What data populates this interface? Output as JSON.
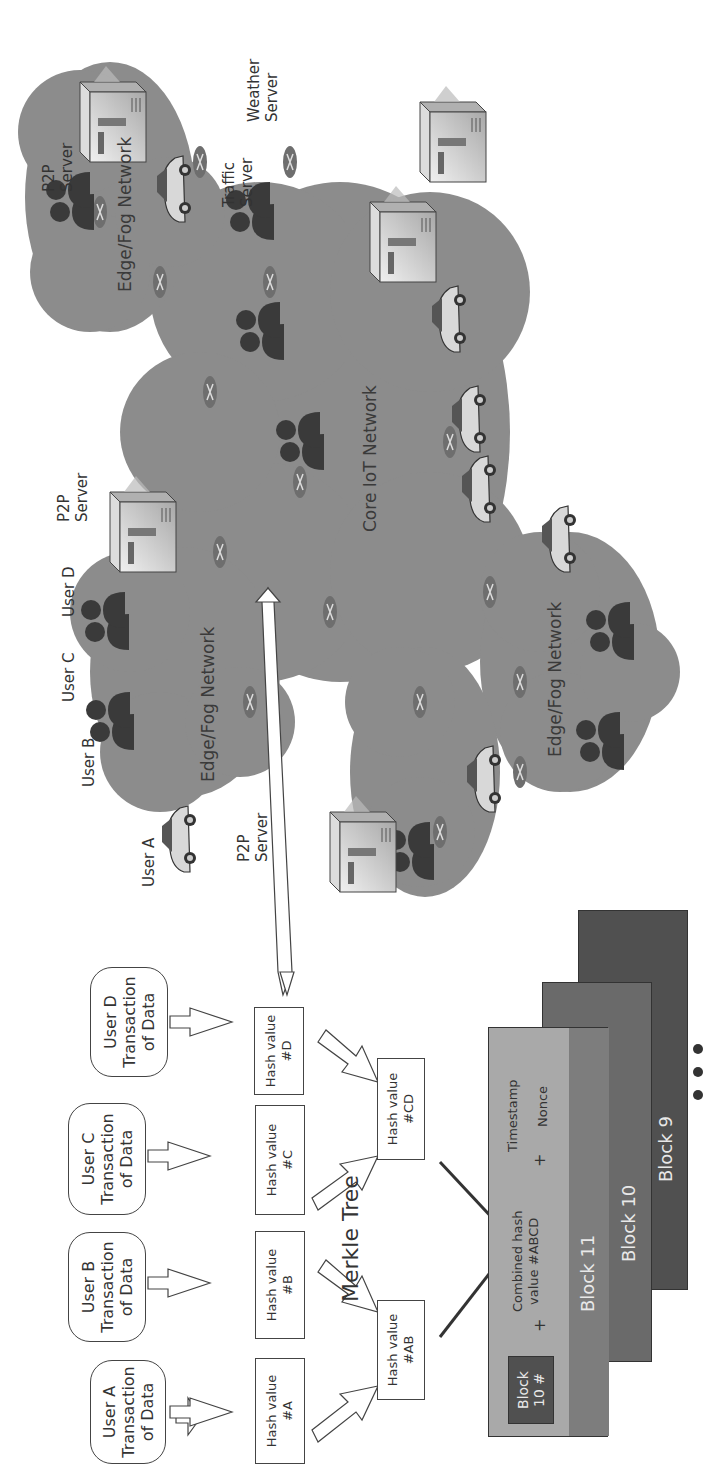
{
  "merkle": {
    "title": "Merkle Tree",
    "transactions": [
      {
        "label": "User A\nTransaction\nof Data"
      },
      {
        "label": "User B\nTransaction\nof Data"
      },
      {
        "label": "User C\nTransaction\nof Data"
      },
      {
        "label": "User D\nTransaction\nof Data"
      }
    ],
    "leaf_hashes": [
      {
        "label": "Hash value\n#A"
      },
      {
        "label": "Hash value\n#B"
      },
      {
        "label": "Hash value\n#C"
      },
      {
        "label": "Hash value\n#D"
      }
    ],
    "pair_hashes": [
      {
        "label": "Hash value\n#AB"
      },
      {
        "label": "Hash value\n#CD"
      }
    ]
  },
  "blockchain": {
    "current_block": {
      "title": "Block 11",
      "prev_ref": "Block\n10 #",
      "plus1": "+",
      "combined": "Combined hash\nvalue #ABCD",
      "plus2": "+",
      "timestamp": "Timestamp",
      "nonce": "Nonce"
    },
    "older_blocks": [
      {
        "title": "Block 10"
      },
      {
        "title": "Block 9"
      }
    ],
    "ellipsis": "..."
  },
  "network": {
    "clouds": [
      {
        "name": "edge-fog-users",
        "label": "Edge/Fog Network"
      },
      {
        "name": "edge-fog-top",
        "label": "Edge/Fog Network"
      },
      {
        "name": "core-iot",
        "label": "Core IoT Network"
      },
      {
        "name": "edge-fog-bottom",
        "label": "Edge/Fog Network"
      }
    ],
    "users": [
      {
        "label": "User A"
      },
      {
        "label": "User B"
      },
      {
        "label": "User C"
      },
      {
        "label": "User D"
      }
    ],
    "servers": [
      {
        "label": "P2P\nServer"
      },
      {
        "label": "P2P\nServer"
      },
      {
        "label": "P2P\nServer"
      },
      {
        "label": "Traffic\nServer"
      },
      {
        "label": "Weather\nServer"
      }
    ]
  },
  "colors": {
    "cloud": "#8c8c8c",
    "person": "#3a3a3a",
    "block_current_light": "#a9a9a9",
    "block_current_dark": "#7d7d7d",
    "block_10": "#6a6a6a",
    "block_9": "#505050",
    "prev_ref_box": "#505050"
  }
}
